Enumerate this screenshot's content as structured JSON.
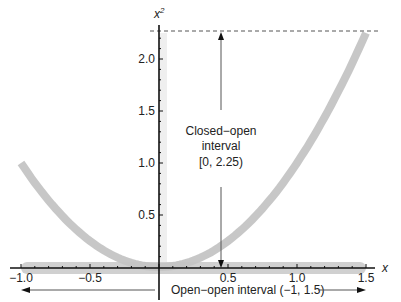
{
  "chart_data": {
    "type": "line",
    "title": "",
    "xlabel": "x",
    "ylabel": "x²",
    "ylabel_base": "x",
    "ylabel_sup": "2",
    "xlim": [
      -1.0,
      1.5
    ],
    "ylim": [
      0,
      2.25
    ],
    "grid": false,
    "x_ticks": [
      {
        "value": -1.0,
        "label": "−1.0"
      },
      {
        "value": -0.5,
        "label": "−0.5"
      },
      {
        "value": 0.5,
        "label": "0.5"
      },
      {
        "value": 1.0,
        "label": "1.0"
      },
      {
        "value": 1.5,
        "label": "1.5"
      }
    ],
    "y_ticks": [
      {
        "value": 0.5,
        "label": "0.5"
      },
      {
        "value": 1.0,
        "label": "1.0"
      },
      {
        "value": 1.5,
        "label": "1.5"
      },
      {
        "value": 2.0,
        "label": "2.0"
      }
    ],
    "series": [
      {
        "name": "x^2 on (-1, 1.5)",
        "function": "x^2",
        "domain": [
          -1.0,
          1.5
        ],
        "x": [
          -1.0,
          -0.75,
          -0.5,
          -0.25,
          0,
          0.25,
          0.5,
          0.75,
          1.0,
          1.25,
          1.5
        ],
        "values": [
          1.0,
          0.5625,
          0.25,
          0.0625,
          0,
          0.0625,
          0.25,
          0.5625,
          1.0,
          1.5625,
          2.25
        ],
        "style": "thick gray band",
        "color": "#c4c4c4"
      }
    ],
    "bands": [
      {
        "name": "domain band",
        "axis": "x",
        "from": -1.0,
        "to": 1.5,
        "color": "#d0d0d0"
      },
      {
        "name": "range band",
        "axis": "y",
        "from": 0,
        "to": 2.25,
        "color": "#ececec"
      }
    ],
    "reference_lines": [
      {
        "type": "horizontal-dashed",
        "y": 2.25
      }
    ],
    "annotations": [
      {
        "text_lines": [
          "Closed−open",
          "interval",
          "[0, 2.25)"
        ],
        "x": 0.45,
        "y": 1.25,
        "arrows": [
          "up to y=2.25",
          "down to y=0"
        ]
      },
      {
        "text": "Open−open interval (−1, 1.5)",
        "y_position": "below x-axis",
        "arrows": [
          "left to x=-1",
          "right to x=1.5"
        ]
      }
    ]
  },
  "annotations": {
    "range_line1": "Closed−open",
    "range_line2": "interval",
    "range_line3": "[0, 2.25)",
    "domain_label": "Open−open interval (−1, 1.5)"
  },
  "colors": {
    "curve": "#c4c4c4",
    "domain_band": "#d0d0d0",
    "range_band": "#efefef",
    "overlap": "#b4b4b4",
    "axis": "#111111",
    "annotation_line": "#555555"
  }
}
